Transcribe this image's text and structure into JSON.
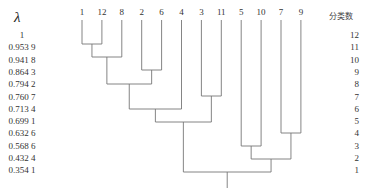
{
  "chart_data": {
    "type": "dendrogram",
    "left_axis_title": "λ",
    "right_axis_title": "分类数",
    "lambda_levels": [
      "1",
      "0.953 9",
      "0.941 8",
      "0.864 3",
      "0.794 2",
      "0.760 7",
      "0.713 4",
      "0.699 1",
      "0.632 6",
      "0.568 6",
      "0.432 4",
      "0.354 1"
    ],
    "cluster_counts": [
      "12",
      "11",
      "10",
      "9",
      "8",
      "7",
      "6",
      "5",
      "4",
      "3",
      "2",
      "1"
    ],
    "leaves": [
      "1",
      "12",
      "8",
      "2",
      "6",
      "4",
      "3",
      "11",
      "5",
      "10",
      "7",
      "9"
    ],
    "merges": [
      {
        "left": "1",
        "right": "12",
        "level": 1
      },
      {
        "left": "1,12",
        "right": "8",
        "level": 2
      },
      {
        "left": "2",
        "right": "6",
        "level": 3
      },
      {
        "left": "1,12,8",
        "right": "2,6",
        "level": 4
      },
      {
        "left": "3",
        "right": "11",
        "level": 5
      },
      {
        "left": "1,12,8,2,6",
        "right": "4",
        "level": 6
      },
      {
        "left": "1,12,8,2,6,4",
        "right": "3,11",
        "level": 7
      },
      {
        "left": "7",
        "right": "9",
        "level": 8
      },
      {
        "left": "5",
        "right": "10",
        "level": 9
      },
      {
        "left": "5,10",
        "right": "7,9",
        "level": 10
      },
      {
        "left": "1,12,8,2,6,4,3,11",
        "right": "5,10,7,9",
        "level": 11
      }
    ]
  }
}
